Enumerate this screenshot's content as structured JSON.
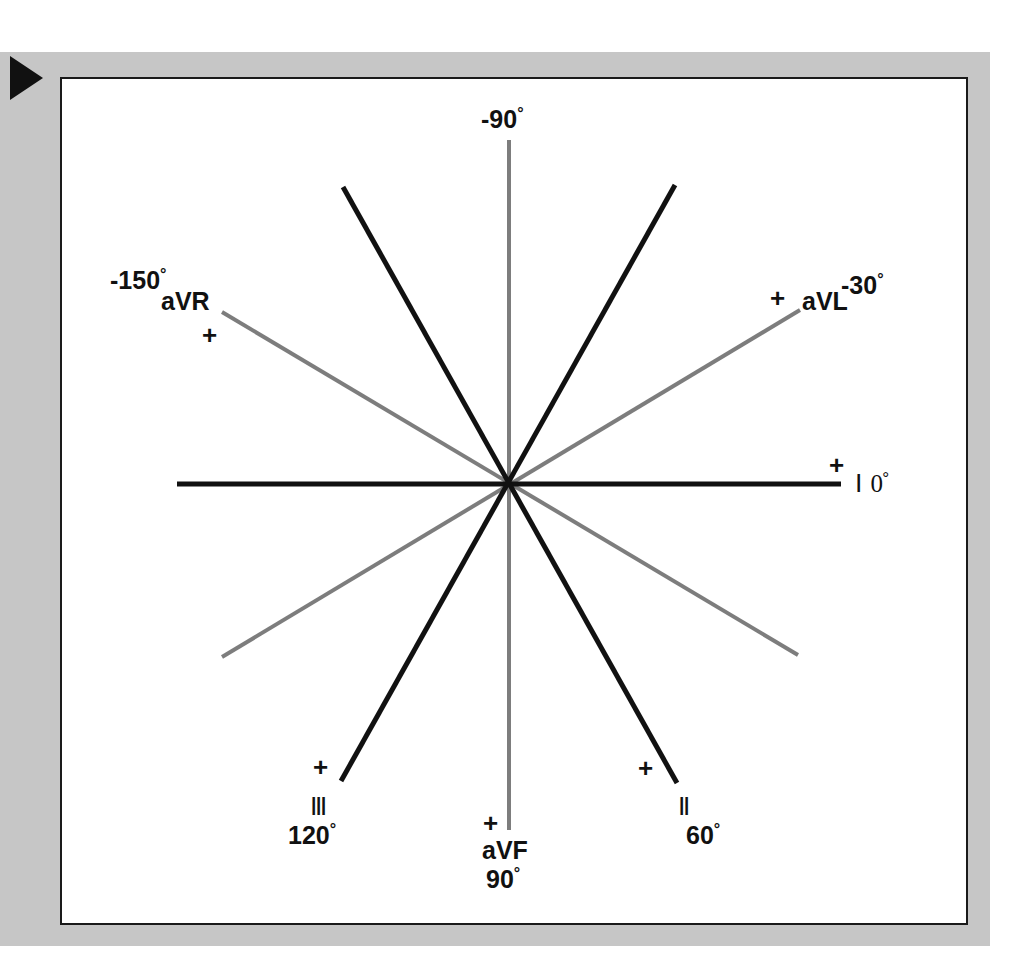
{
  "figure": {
    "kind": "hexaxial-reference-system",
    "marker_icon": "play-triangle-icon",
    "colors": {
      "plate_background": "#ffffff",
      "mat_background": "#c6c6c6",
      "plate_border": "#1a1a1a",
      "bipolar_lead_line": "#111111",
      "augmented_lead_line": "#7d7d7d",
      "text": "#111111"
    },
    "degree_symbol": "°",
    "plus_symbol": "+"
  },
  "chart_data": {
    "type": "scatter",
    "title": "",
    "subtitle": "",
    "xlabel": "",
    "ylabel": "",
    "grid": false,
    "legend_position": "none",
    "center": {
      "x": 510,
      "y": 484
    },
    "axes": [
      {
        "lead": "I",
        "lead_display": "Ⅰ",
        "angle_deg": 0,
        "angle_label": "0°",
        "label_text": "Ⅰ 0°",
        "color": "#111111",
        "style": "bipolar",
        "positive_end": "right",
        "plus_marker": true,
        "x1": 177,
        "y1": 484,
        "x2": 841,
        "y2": 484,
        "thickness": 5
      },
      {
        "lead": "II",
        "lead_display": "Ⅱ",
        "angle_deg": 60,
        "angle_label": "60°",
        "label_text": "Ⅱ 60°",
        "color": "#111111",
        "style": "bipolar",
        "positive_end": "lower-right",
        "plus_marker": true,
        "x1": 343,
        "y1": 187,
        "x2": 677,
        "y2": 783,
        "thickness": 5
      },
      {
        "lead": "III",
        "lead_display": "Ⅲ",
        "angle_deg": 120,
        "angle_label": "120°",
        "label_text": "Ⅲ 120°",
        "color": "#111111",
        "style": "bipolar",
        "positive_end": "lower-left",
        "plus_marker": true,
        "x1": 675,
        "y1": 185,
        "x2": 341,
        "y2": 781,
        "thickness": 5
      },
      {
        "lead": "aVR",
        "lead_display": "aVR",
        "angle_deg": -150,
        "angle_label": "-150°",
        "label_text": "aVR -150°",
        "color": "#7d7d7d",
        "style": "augmented",
        "positive_end": "upper-left",
        "plus_marker": true,
        "x1": 222,
        "y1": 312,
        "x2": 798,
        "y2": 655,
        "thickness": 4
      },
      {
        "lead": "aVL",
        "lead_display": "aVL",
        "angle_deg": -30,
        "angle_label": "-30°",
        "label_text": "aVL -30°",
        "color": "#7d7d7d",
        "style": "augmented",
        "positive_end": "upper-right",
        "plus_marker": true,
        "x1": 222,
        "y1": 657,
        "x2": 800,
        "y2": 310,
        "thickness": 4
      },
      {
        "lead": "aVF",
        "lead_display": "aVF",
        "angle_deg": 90,
        "angle_label": "90°",
        "label_text": "aVF 90°",
        "color": "#7d7d7d",
        "style": "augmented",
        "positive_end": "bottom",
        "plus_marker": true,
        "x1": 509,
        "y1": 140,
        "x2": 509,
        "y2": 830,
        "thickness": 4
      }
    ],
    "annotations": [
      {
        "id": "top",
        "text": "-90°",
        "x": 483,
        "y": 108
      },
      {
        "id": "aVR-deg",
        "text": "-150°",
        "x": 110,
        "y": 268
      },
      {
        "id": "aVR-name",
        "text": "aVR",
        "x": 163,
        "y": 290
      },
      {
        "id": "aVR-plus",
        "text": "+",
        "x": 203,
        "y": 322
      },
      {
        "id": "aVL-plus",
        "text": "+",
        "x": 771,
        "y": 285
      },
      {
        "id": "aVL-name",
        "text": "aVL",
        "x": 803,
        "y": 290
      },
      {
        "id": "aVL-deg",
        "text": "-30°",
        "x": 843,
        "y": 272
      },
      {
        "id": "I-plus",
        "text": "+",
        "x": 830,
        "y": 452
      },
      {
        "id": "I-name-deg",
        "text": "Ⅰ 0°",
        "x": 857,
        "y": 470
      },
      {
        "id": "III-plus",
        "text": "+",
        "x": 314,
        "y": 755
      },
      {
        "id": "III-name",
        "text": "Ⅲ",
        "x": 312,
        "y": 793
      },
      {
        "id": "III-deg",
        "text": "120°",
        "x": 288,
        "y": 822
      },
      {
        "id": "aVF-plus",
        "text": "+",
        "x": 483,
        "y": 810
      },
      {
        "id": "aVF-name",
        "text": "aVF",
        "x": 483,
        "y": 838
      },
      {
        "id": "aVF-deg",
        "text": "90°",
        "x": 486,
        "y": 866
      },
      {
        "id": "II-plus",
        "text": "+",
        "x": 639,
        "y": 756
      },
      {
        "id": "II-name",
        "text": "Ⅱ",
        "x": 679,
        "y": 793
      },
      {
        "id": "II-deg",
        "text": "60°",
        "x": 686,
        "y": 822
      }
    ]
  },
  "labels": {
    "top_minus90": {
      "num": "-90",
      "deg": "°"
    },
    "avr": {
      "deg_num": "-150",
      "deg": "°",
      "name": "aVR",
      "plus": "+"
    },
    "avl": {
      "plus": "+",
      "name": "aVL",
      "deg_num": "-30",
      "deg": "°"
    },
    "lead_i": {
      "plus": "+",
      "name": "Ⅰ",
      "deg_num": "0",
      "deg": "°"
    },
    "lead_iii": {
      "plus": "+",
      "name": "Ⅲ",
      "deg_num": "120",
      "deg": "°"
    },
    "avf": {
      "plus": "+",
      "name": "aVF",
      "deg_num": "90",
      "deg": "°"
    },
    "lead_ii": {
      "plus": "+",
      "name": "Ⅱ",
      "deg_num": "60",
      "deg": "°"
    }
  }
}
